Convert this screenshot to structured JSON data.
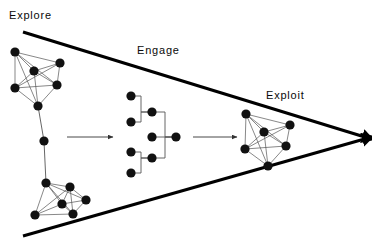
{
  "diagram": {
    "background_color": "#ffffff",
    "ink_color": "#000000",
    "node_color": "#111111",
    "edge_color": "#555555",
    "labels": {
      "explore": "Explore",
      "engage": "Engage",
      "exploit": "Exploit"
    },
    "funnel": {
      "top_line": {
        "x1": 23,
        "y1": 32,
        "x2": 368,
        "y2": 138
      },
      "bottom_line": {
        "x1": 23,
        "y1": 236,
        "x2": 368,
        "y2": 138
      },
      "stroke_width": 3,
      "arrow_tip": {
        "x": 368,
        "y": 138
      }
    },
    "flow_arrows": [
      {
        "name": "arrow-explore-to-engage",
        "x1": 67,
        "y1": 137,
        "x2": 113,
        "y2": 137
      },
      {
        "name": "arrow-engage-to-exploit",
        "x1": 193,
        "y1": 137,
        "x2": 237,
        "y2": 137
      }
    ],
    "clusters": [
      {
        "name": "explore-cluster-upper",
        "nodes": [
          {
            "id": "u1",
            "x": 15,
            "y": 52,
            "r": 4.6
          },
          {
            "id": "u2",
            "x": 60,
            "y": 63,
            "r": 4.6
          },
          {
            "id": "u3",
            "x": 34,
            "y": 71,
            "r": 4.6
          },
          {
            "id": "u4",
            "x": 15,
            "y": 88,
            "r": 4.6
          },
          {
            "id": "u5",
            "x": 57,
            "y": 85,
            "r": 4.6
          },
          {
            "id": "u6",
            "x": 38,
            "y": 106,
            "r": 4.6
          }
        ],
        "edges": [
          [
            "u1",
            "u2"
          ],
          [
            "u1",
            "u3"
          ],
          [
            "u1",
            "u4"
          ],
          [
            "u1",
            "u5"
          ],
          [
            "u1",
            "u6"
          ],
          [
            "u2",
            "u3"
          ],
          [
            "u2",
            "u4"
          ],
          [
            "u2",
            "u5"
          ],
          [
            "u3",
            "u4"
          ],
          [
            "u3",
            "u5"
          ],
          [
            "u3",
            "u6"
          ],
          [
            "u4",
            "u5"
          ],
          [
            "u4",
            "u6"
          ],
          [
            "u5",
            "u6"
          ]
        ]
      },
      {
        "name": "explore-cluster-lower",
        "nodes": [
          {
            "id": "l1",
            "x": 46,
            "y": 183,
            "r": 4.6
          },
          {
            "id": "l2",
            "x": 70,
            "y": 187,
            "r": 4.6
          },
          {
            "id": "l3",
            "x": 86,
            "y": 200,
            "r": 4.6
          },
          {
            "id": "l4",
            "x": 62,
            "y": 204,
            "r": 4.6
          },
          {
            "id": "l5",
            "x": 35,
            "y": 215,
            "r": 4.6
          },
          {
            "id": "l6",
            "x": 73,
            "y": 214,
            "r": 4.6
          }
        ],
        "edges": [
          [
            "l1",
            "l2"
          ],
          [
            "l1",
            "l3"
          ],
          [
            "l1",
            "l4"
          ],
          [
            "l1",
            "l5"
          ],
          [
            "l1",
            "l6"
          ],
          [
            "l2",
            "l3"
          ],
          [
            "l2",
            "l4"
          ],
          [
            "l2",
            "l5"
          ],
          [
            "l2",
            "l6"
          ],
          [
            "l3",
            "l4"
          ],
          [
            "l3",
            "l6"
          ],
          [
            "l4",
            "l5"
          ],
          [
            "l4",
            "l6"
          ],
          [
            "l5",
            "l6"
          ]
        ]
      },
      {
        "name": "exploit-cluster",
        "nodes": [
          {
            "id": "e1",
            "x": 246,
            "y": 114,
            "r": 4.6
          },
          {
            "id": "e2",
            "x": 290,
            "y": 125,
            "r": 4.6
          },
          {
            "id": "e3",
            "x": 264,
            "y": 132,
            "r": 4.6
          },
          {
            "id": "e4",
            "x": 245,
            "y": 149,
            "r": 4.6
          },
          {
            "id": "e5",
            "x": 286,
            "y": 146,
            "r": 4.6
          },
          {
            "id": "e6",
            "x": 268,
            "y": 166,
            "r": 4.6
          }
        ],
        "edges": [
          [
            "e1",
            "e2"
          ],
          [
            "e1",
            "e3"
          ],
          [
            "e1",
            "e4"
          ],
          [
            "e1",
            "e5"
          ],
          [
            "e1",
            "e6"
          ],
          [
            "e2",
            "e3"
          ],
          [
            "e2",
            "e4"
          ],
          [
            "e2",
            "e5"
          ],
          [
            "e3",
            "e4"
          ],
          [
            "e3",
            "e5"
          ],
          [
            "e3",
            "e6"
          ],
          [
            "e4",
            "e5"
          ],
          [
            "e4",
            "e6"
          ],
          [
            "e5",
            "e6"
          ]
        ]
      }
    ],
    "connector_chain": {
      "name": "explore-cluster-connector",
      "nodes": [
        {
          "id": "c1",
          "x": 44,
          "y": 141,
          "r": 4.6
        }
      ],
      "segments": [
        {
          "x1": 38,
          "y1": 106,
          "x2": 44,
          "y2": 141
        },
        {
          "x1": 44,
          "y1": 141,
          "x2": 46,
          "y2": 183
        }
      ]
    },
    "tree": {
      "name": "engage-tree",
      "nodes": [
        {
          "id": "t1",
          "x": 131,
          "y": 96,
          "r": 4.6
        },
        {
          "id": "t2",
          "x": 131,
          "y": 122,
          "r": 4.6
        },
        {
          "id": "t3",
          "x": 131,
          "y": 152,
          "r": 4.6
        },
        {
          "id": "t4",
          "x": 131,
          "y": 173,
          "r": 4.6
        },
        {
          "id": "t5",
          "x": 152,
          "y": 112,
          "r": 4.6
        },
        {
          "id": "t6",
          "x": 152,
          "y": 158,
          "r": 4.6
        },
        {
          "id": "t7",
          "x": 152,
          "y": 137,
          "r": 4.6
        },
        {
          "id": "t8",
          "x": 176,
          "y": 137,
          "r": 4.6
        }
      ],
      "links": [
        {
          "from": "t1",
          "to": "t5",
          "mid_x": 141
        },
        {
          "from": "t2",
          "to": "t5",
          "mid_x": 141
        },
        {
          "from": "t3",
          "to": "t6",
          "mid_x": 141
        },
        {
          "from": "t4",
          "to": "t6",
          "mid_x": 141
        },
        {
          "from": "t5",
          "to": "t8",
          "mid_x": 165
        },
        {
          "from": "t6",
          "to": "t8",
          "mid_x": 165
        },
        {
          "from": "t7",
          "to": "t8",
          "mid_x": 165
        }
      ]
    }
  }
}
